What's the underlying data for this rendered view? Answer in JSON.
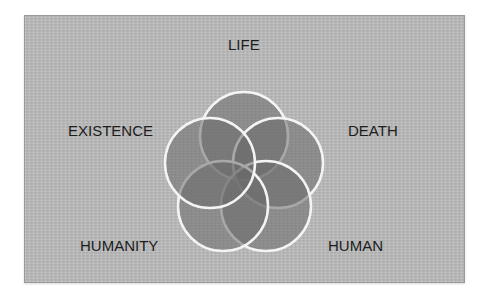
{
  "diagram": {
    "type": "five-circle-venn",
    "labels": {
      "top": "LIFE",
      "left": "EXISTENCE",
      "right": "DEATH",
      "bottom_left": "HUMANITY",
      "bottom_right": "HUMAN"
    },
    "colors": {
      "panel_background": "#b8b8b8",
      "circle_fill": "#6e6e6e",
      "circle_stroke": "#f2f2f2",
      "text": "#1c1c1c"
    }
  }
}
